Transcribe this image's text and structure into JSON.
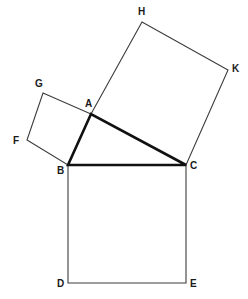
{
  "figure": {
    "background_color": "#ffffff",
    "stroke_color": "#3c3c3c",
    "triangle_stroke_color": "#111111",
    "label_color": "#1a1a1a",
    "thin_stroke_width": 1.1,
    "thick_stroke_width": 2.6,
    "canvas": {
      "width": 248,
      "height": 299
    }
  },
  "points": {
    "A": {
      "label": "A",
      "x": 91,
      "y": 114,
      "label_x": 85,
      "label_y": 99
    },
    "B": {
      "label": "B",
      "x": 68,
      "y": 165,
      "label_x": 57,
      "label_y": 166
    },
    "C": {
      "label": "C",
      "x": 186,
      "y": 165,
      "label_x": 190,
      "label_y": 161
    },
    "D": {
      "label": "D",
      "x": 68,
      "y": 283,
      "label_x": 57,
      "label_y": 279
    },
    "E": {
      "label": "E",
      "x": 186,
      "y": 283,
      "label_x": 190,
      "label_y": 279
    },
    "F": {
      "label": "F",
      "x": 27,
      "y": 140,
      "label_x": 13,
      "label_y": 136
    },
    "G": {
      "label": "G",
      "x": 43,
      "y": 93,
      "label_x": 35,
      "label_y": 79
    },
    "H": {
      "label": "H",
      "x": 142,
      "y": 22,
      "label_x": 138,
      "label_y": 7
    },
    "K": {
      "label": "K",
      "x": 228,
      "y": 70,
      "label_x": 232,
      "label_y": 64
    }
  },
  "shapes": {
    "square_on_bc": {
      "name": "square-bced",
      "vertex_order": [
        "B",
        "C",
        "E",
        "D"
      ],
      "path": "68,165 186,165 186,283 68,283",
      "weight": "thin"
    },
    "square_on_ab": {
      "name": "square-abfg",
      "vertex_order": [
        "A",
        "B",
        "F",
        "G"
      ],
      "path": "91,114 68,165 27,140 43,93",
      "weight": "thin"
    },
    "square_on_ac": {
      "name": "square-achk",
      "vertex_order": [
        "A",
        "C",
        "K",
        "H"
      ],
      "path": "91,114 186,165 228,70 142,22",
      "weight": "thin"
    },
    "triangle": {
      "name": "right-triangle-abc",
      "vertex_order": [
        "A",
        "B",
        "C"
      ],
      "path": "91,114 68,165 186,165",
      "weight": "thick"
    }
  },
  "segments": [
    {
      "name": "segment-ab",
      "from": "A",
      "to": "B",
      "weight": "thick"
    },
    {
      "name": "segment-bc",
      "from": "B",
      "to": "C",
      "weight": "thick"
    },
    {
      "name": "segment-ca",
      "from": "C",
      "to": "A",
      "weight": "thick"
    }
  ]
}
